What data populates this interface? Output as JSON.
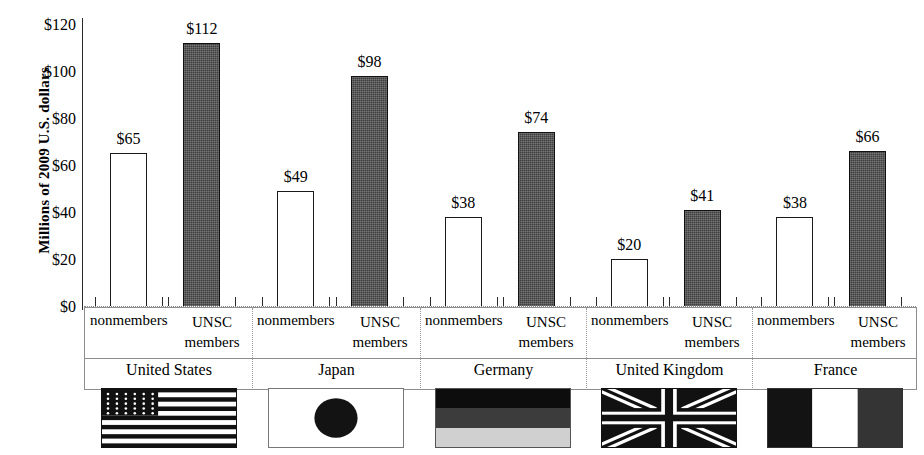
{
  "chart_data": {
    "type": "bar",
    "title": "",
    "xlabel": "",
    "ylabel": "Millions of 2009 U.S. dollars",
    "ylim": [
      0,
      120
    ],
    "ytick_labels": [
      "$120",
      "$100",
      "$80",
      "$60",
      "$40",
      "$20",
      "$0"
    ],
    "ytick_values": [
      120,
      100,
      80,
      60,
      40,
      20,
      0
    ],
    "grid": false,
    "legend": "none",
    "categories": [
      "United States",
      "Japan",
      "Germany",
      "United Kingdom",
      "France"
    ],
    "series": [
      {
        "name": "nonmembers",
        "values": [
          65,
          49,
          38,
          20,
          38
        ],
        "value_labels": [
          "$65",
          "$49",
          "$38",
          "$20",
          "$38"
        ],
        "style": "open"
      },
      {
        "name": "UNSC members",
        "values": [
          112,
          98,
          74,
          41,
          66
        ],
        "value_labels": [
          "$112",
          "$98",
          "$74",
          "$41",
          "$66"
        ],
        "style": "filled"
      }
    ],
    "group_labels": {
      "nonmembers": "nonmembers",
      "unsc_line1": "UNSC",
      "unsc_line2": "members"
    },
    "flags": [
      {
        "country": "United States",
        "icon": "flag-united-states"
      },
      {
        "country": "Japan",
        "icon": "flag-japan"
      },
      {
        "country": "Germany",
        "icon": "flag-germany"
      },
      {
        "country": "United Kingdom",
        "icon": "flag-united-kingdom"
      },
      {
        "country": "France",
        "icon": "flag-france"
      }
    ]
  },
  "colors": {
    "open_bar_fill": "#ffffff",
    "open_bar_stroke": "#1a1a1a",
    "filled_bar_fill": "#3f3f3f",
    "axis": "#2b2b2b",
    "table_border": "#8d8d8d",
    "background": "#ffffff"
  }
}
